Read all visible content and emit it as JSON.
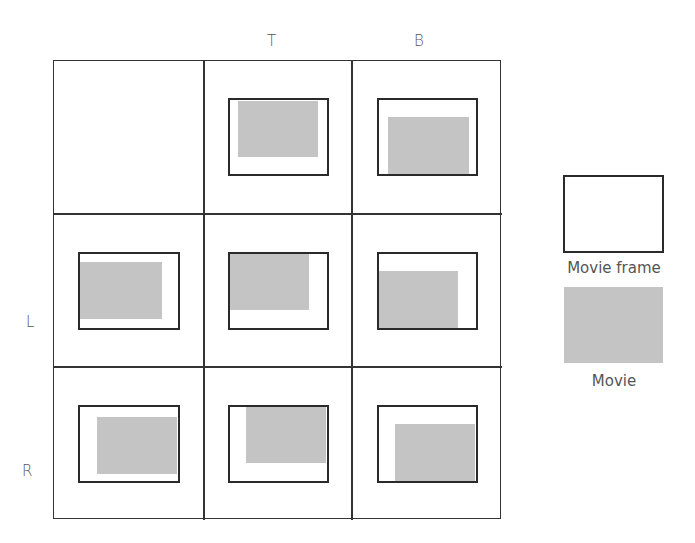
{
  "column_headers": [
    "",
    "T",
    "B"
  ],
  "row_headers": [
    "",
    "L",
    "R"
  ],
  "legend": {
    "frame_label": "Movie frame",
    "movie_label": "Movie"
  },
  "colors": {
    "frame_border": "#2a2a2a",
    "movie_fill": "#c4c4c4",
    "grid_line": "#333333",
    "text": "#555555"
  },
  "cells": [
    {
      "row": 0,
      "col": 0,
      "empty": true
    },
    {
      "row": 0,
      "col": 1,
      "alignment": "T"
    },
    {
      "row": 0,
      "col": 2,
      "alignment": "B"
    },
    {
      "row": 1,
      "col": 0,
      "alignment": "L"
    },
    {
      "row": 1,
      "col": 1,
      "alignment": "T+L"
    },
    {
      "row": 1,
      "col": 2,
      "alignment": "B+L"
    },
    {
      "row": 2,
      "col": 0,
      "alignment": "R"
    },
    {
      "row": 2,
      "col": 1,
      "alignment": "T+R"
    },
    {
      "row": 2,
      "col": 2,
      "alignment": "B+R"
    }
  ]
}
